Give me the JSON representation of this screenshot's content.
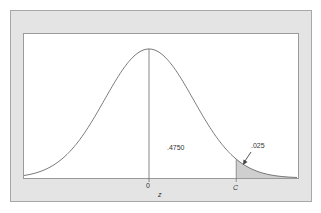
{
  "chart_data": {
    "type": "area",
    "title": "",
    "xlabel": "z",
    "ylabel": "",
    "x_ticks": [
      {
        "label": "0",
        "z": 0
      },
      {
        "label": "C",
        "z": 1.96
      }
    ],
    "distribution": {
      "name": "standard normal",
      "mean": 0,
      "sd": 1
    },
    "x_range": [
      -2.85,
      3.3
    ],
    "regions": [
      {
        "name": "center-to-C",
        "from_z": 0,
        "to_z": 1.96,
        "area": 0.475,
        "label": ".4750",
        "shaded": false
      },
      {
        "name": "right-tail",
        "from_z": 1.96,
        "to_z": "inf",
        "area": 0.025,
        "label": ".025",
        "shaded": true
      }
    ],
    "annotations": [
      {
        "text": ".4750",
        "position": "between 0 and C, below curve"
      },
      {
        "text": ".025",
        "position": "above right tail, with arrow pointing to shaded area"
      }
    ],
    "grid": false,
    "legend": null
  },
  "labels": {
    "center_tick": "0",
    "critical_tick": "C",
    "axis_variable": "z",
    "middle_area": ".4750",
    "tail_area": ".025"
  },
  "colors": {
    "frame_bg": "#e4e4e4",
    "plot_bg": "#ffffff",
    "curve": "#6b6b6b",
    "shade": "#cfcfcf"
  }
}
